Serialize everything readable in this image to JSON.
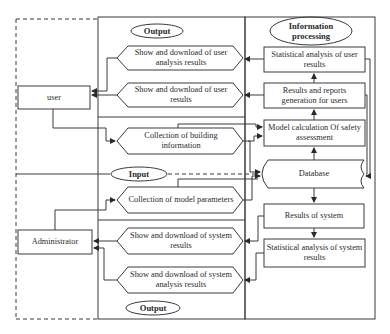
{
  "actors": {
    "user": "user",
    "administrator": "Administrator"
  },
  "sections": {
    "output_top": "Output",
    "input": "Input",
    "output_bottom": "Output",
    "info_processing": "Information processing"
  },
  "interface": {
    "show_user_analysis": "Show and download of user analysis results",
    "show_user_results": "Show and download of user results",
    "collect_building": "Collection of building information",
    "collect_model": "Collection of model parameters",
    "show_system_results": "Show and download of system results",
    "show_system_analysis": "Show and download of system analysis results"
  },
  "processing": {
    "stat_user": "Statistical analysis of user results",
    "results_reports": "Results and reports generation for users",
    "model_calc": "Model calculation Of safety assessment",
    "database": "Database",
    "results_system": "Results of system",
    "stat_system": "Statistical analysis of system results"
  },
  "colors": {
    "line": "#3a3a3a",
    "text": "#2a2a2a",
    "background": "#ffffff"
  }
}
